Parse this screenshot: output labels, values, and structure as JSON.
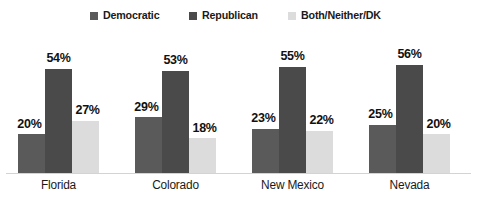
{
  "chart_data": {
    "type": "bar",
    "title": "",
    "subtitle": "",
    "xlabel": "",
    "ylabel": "",
    "ylim": [
      0,
      60
    ],
    "grid": false,
    "legend_position": "top-center",
    "value_suffix": "%",
    "categories": [
      "Florida",
      "Colorado",
      "New Mexico",
      "Nevada"
    ],
    "series": [
      {
        "name": "Democratic",
        "color": "#5a5a5a",
        "values": [
          20,
          29,
          23,
          25
        ],
        "labels": [
          "20%",
          "29%",
          "23%",
          "25%"
        ]
      },
      {
        "name": "Republican",
        "color": "#4a4a4a",
        "values": [
          54,
          53,
          55,
          56
        ],
        "labels": [
          "54%",
          "53%",
          "55%",
          "56%"
        ]
      },
      {
        "name": "Both/Neither/DK",
        "color": "#dcdcdc",
        "values": [
          27,
          18,
          22,
          20
        ],
        "labels": [
          "27%",
          "18%",
          "22%",
          "20%"
        ]
      }
    ]
  },
  "legend": {
    "items": [
      {
        "label": "Democratic",
        "color": "#5a5a5a"
      },
      {
        "label": "Republican",
        "color": "#4a4a4a"
      },
      {
        "label": "Both/Neither/DK",
        "color": "#dcdcdc"
      }
    ]
  },
  "axis": {
    "baseline_color": "#d3d3d3"
  }
}
